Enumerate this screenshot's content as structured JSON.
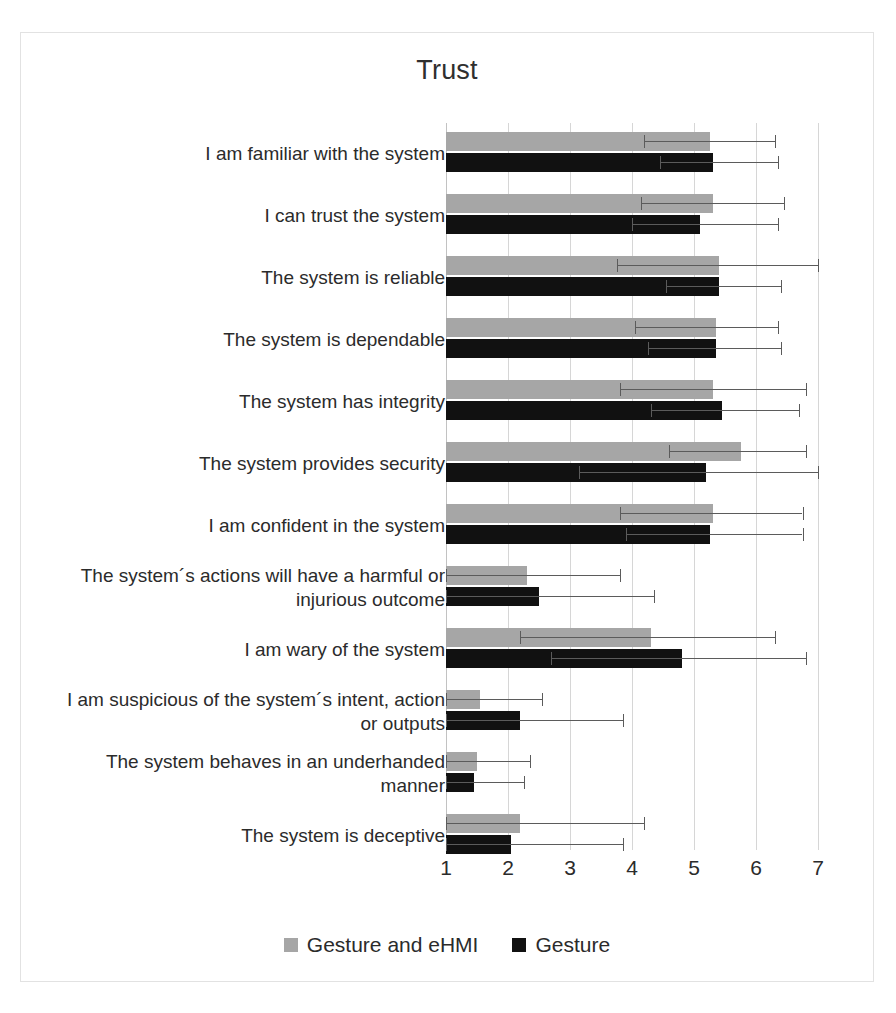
{
  "chart_data": {
    "type": "bar",
    "orientation": "horizontal",
    "title": "Trust",
    "xlabel": "",
    "ylabel": "",
    "xlim": [
      1,
      7
    ],
    "xticks": [
      1,
      2,
      3,
      4,
      5,
      6,
      7
    ],
    "grid": true,
    "legend_position": "bottom",
    "categories": [
      "I am familiar with the system",
      "I can trust the system",
      "The system is reliable",
      "The system is dependable",
      "The system has integrity",
      "The system provides security",
      "I am confident in the system",
      "The system´s actions will have a harmful or injurious outcome",
      "I am wary of the system",
      "I am suspicious of the system´s intent, action or outputs",
      "The system behaves in an underhanded manner",
      "The system is deceptive"
    ],
    "series": [
      {
        "name": "Gesture and eHMI",
        "color": "#a6a6a6",
        "values": [
          5.25,
          5.3,
          5.4,
          5.35,
          5.3,
          5.75,
          5.3,
          2.3,
          4.3,
          1.55,
          1.5,
          2.2
        ],
        "error_low": [
          4.2,
          4.15,
          3.75,
          4.05,
          3.8,
          4.6,
          3.8,
          1.0,
          2.2,
          1.0,
          1.0,
          1.0
        ],
        "error_high": [
          6.3,
          6.45,
          7.0,
          6.35,
          6.8,
          6.8,
          6.75,
          3.8,
          6.3,
          2.55,
          2.35,
          4.2
        ]
      },
      {
        "name": "Gesture",
        "color": "#111111",
        "values": [
          5.3,
          5.1,
          5.4,
          5.35,
          5.45,
          5.2,
          5.25,
          2.5,
          4.8,
          2.2,
          1.45,
          2.05
        ],
        "error_low": [
          4.45,
          4.0,
          4.55,
          4.25,
          4.3,
          3.15,
          3.9,
          1.0,
          2.7,
          1.0,
          1.0,
          1.0
        ],
        "error_high": [
          6.35,
          6.35,
          6.4,
          6.4,
          6.7,
          7.0,
          6.75,
          4.35,
          6.8,
          3.85,
          2.25,
          3.85
        ]
      }
    ]
  },
  "legend": {
    "entries": [
      {
        "label": "Gesture and eHMI",
        "color": "#a6a6a6"
      },
      {
        "label": "Gesture",
        "color": "#111111"
      }
    ]
  }
}
